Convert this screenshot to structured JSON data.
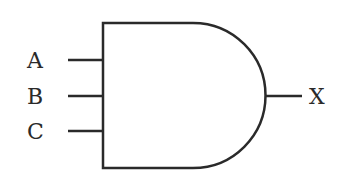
{
  "diagram": {
    "type": "logic-gate",
    "gate": "AND",
    "inputs": [
      {
        "label": "A"
      },
      {
        "label": "B"
      },
      {
        "label": "C"
      }
    ],
    "output": {
      "label": "X"
    },
    "colors": {
      "stroke": "#2a2a2a",
      "background": "#ffffff"
    }
  }
}
